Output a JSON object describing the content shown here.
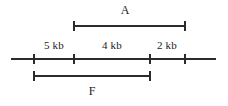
{
  "figure": {
    "kind": "restriction-map",
    "background_color": "#ffffff",
    "line_color": "#2b2b2b",
    "text_color": "#1a1a1a",
    "width": 228,
    "height": 106
  },
  "axis": {
    "name": "dna-axis",
    "x_start": 11,
    "x_end": 216,
    "y": 59,
    "ticks": [
      {
        "id": "tick-1",
        "x": 34
      },
      {
        "id": "tick-2",
        "x": 74
      },
      {
        "id": "tick-3",
        "x": 150
      },
      {
        "id": "tick-4",
        "x": 185
      }
    ],
    "tick_half_height": 5
  },
  "segments": [
    {
      "id": "segment-5kb",
      "label": "5 kb",
      "x": 54,
      "y": 49,
      "from_x": 34,
      "to_x": 74
    },
    {
      "id": "segment-4kb",
      "label": "4 kb",
      "x": 112,
      "y": 49,
      "from_x": 74,
      "to_x": 150
    },
    {
      "id": "segment-2kb",
      "label": "2 kb",
      "x": 167,
      "y": 49,
      "from_x": 150,
      "to_x": 185
    }
  ],
  "fragments": [
    {
      "id": "fragment-a",
      "label": "A",
      "label_x": 125,
      "label_y": 14,
      "bar_y": 26,
      "x_start": 74,
      "x_end": 185,
      "cap_half_height": 5,
      "position": "above"
    },
    {
      "id": "fragment-f",
      "label": "F",
      "label_x": 92,
      "label_y": 95,
      "bar_y": 76,
      "x_start": 34,
      "x_end": 150,
      "cap_half_height": 5,
      "position": "below"
    }
  ]
}
